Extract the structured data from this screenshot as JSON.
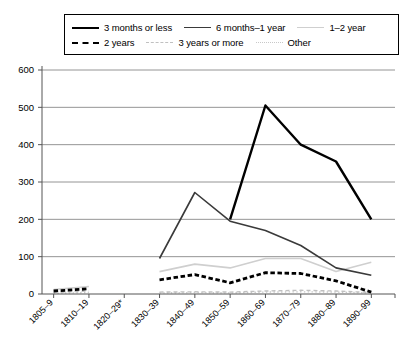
{
  "legend": {
    "rows": [
      [
        {
          "label": "3 months or less",
          "style": "solid-thick",
          "color": "#000000"
        },
        {
          "label": "6 months–1 year",
          "style": "solid-med",
          "color": "#3a3a3a"
        },
        {
          "label": "1–2 year",
          "style": "solid-light",
          "color": "#cfcfcf"
        }
      ],
      [
        {
          "label": "2 years",
          "style": "dashed-thick",
          "color": "#000000"
        },
        {
          "label": "3 years or more",
          "style": "dashed-light",
          "color": "#c0c0c0"
        },
        {
          "label": "Other",
          "style": "dotted-light",
          "color": "#c8c8c8"
        }
      ]
    ]
  },
  "chart_data": {
    "type": "line",
    "title": "",
    "xlabel": "",
    "ylabel": "",
    "ylim": [
      0,
      600
    ],
    "ytick_step": 100,
    "yticks": [
      "0",
      "100",
      "200",
      "300",
      "400",
      "500",
      "600"
    ],
    "grid": true,
    "legend_position": "top",
    "categories": [
      "1805–9",
      "1810–19",
      "1820–29*",
      "1830–39",
      "1840–49",
      "1850–59",
      "1860–69",
      "1870–79",
      "1880–89",
      "1890–99"
    ],
    "series": [
      {
        "name": "3 months or less",
        "color": "#000000",
        "style": "solid-thick",
        "values": [
          null,
          null,
          null,
          null,
          null,
          200,
          505,
          400,
          355,
          200
        ]
      },
      {
        "name": "6 months–1 year",
        "color": "#3a3a3a",
        "style": "solid-med",
        "values": [
          null,
          null,
          null,
          95,
          272,
          195,
          170,
          130,
          70,
          50
        ]
      },
      {
        "name": "1–2 year",
        "color": "#cfcfcf",
        "style": "solid-light",
        "values": [
          12,
          20,
          null,
          60,
          80,
          70,
          95,
          95,
          60,
          85
        ]
      },
      {
        "name": "2 years",
        "color": "#000000",
        "style": "dashed-thick",
        "values": [
          8,
          14,
          null,
          38,
          52,
          30,
          57,
          55,
          35,
          5
        ]
      },
      {
        "name": "3 years or more",
        "color": "#c0c0c0",
        "style": "dashed-light",
        "values": [
          4,
          8,
          null,
          5,
          6,
          5,
          8,
          10,
          8,
          4
        ]
      },
      {
        "name": "Other",
        "color": "#c8c8c8",
        "style": "dotted-light",
        "values": [
          2,
          4,
          null,
          3,
          4,
          3,
          5,
          6,
          5,
          3
        ]
      }
    ]
  }
}
